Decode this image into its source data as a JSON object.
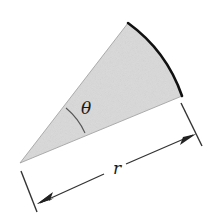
{
  "diagram": {
    "type": "circular-sector",
    "labels": {
      "angle": "θ",
      "radius": "r"
    },
    "colors": {
      "sector_fill": "#d9d9d9",
      "arc_stroke": "#111111",
      "edge_stroke": "#8a8a8a",
      "dimension_stroke": "#333333",
      "background": "#ffffff"
    },
    "geometry": {
      "apex": [
        20,
        163
      ],
      "arc_start": [
        128,
        23
      ],
      "arc_end": [
        182,
        96
      ],
      "dimension_line": {
        "from": [
          38,
          204
        ],
        "to": [
          195,
          134
        ]
      }
    }
  }
}
